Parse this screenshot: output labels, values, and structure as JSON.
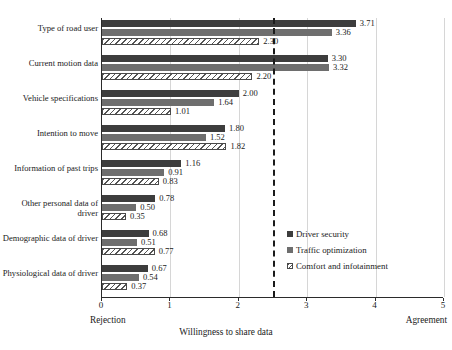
{
  "chart_data": {
    "type": "bar",
    "orientation": "horizontal",
    "title": "",
    "xlabel": "Willingness to share data",
    "ylabel": "",
    "xlim": [
      0,
      5
    ],
    "xticks": [
      0,
      1,
      2,
      3,
      4
    ],
    "xtick_labels": [
      "0",
      "1",
      "2",
      "3",
      "4",
      "5"
    ],
    "xtick_values": [
      0,
      1,
      2,
      3,
      4,
      5
    ],
    "grid": true,
    "grid_axis": "x",
    "legend_position": "inside-right",
    "axis_endpoint_labels": {
      "left": "Rejection",
      "right": "Agreement"
    },
    "reference_line": {
      "value": 2.5,
      "style": "dashed",
      "color": "#1a1a1a"
    },
    "categories": [
      "Type of road user",
      "Current motion data",
      "Vehicle specifications",
      "Intention to move",
      "Information of past trips",
      "Other personal data of driver",
      "Demographic data of driver",
      "Physiological data of driver"
    ],
    "series": [
      {
        "name": "Driver security",
        "color": "#3d3d3d",
        "pattern": "solid-dark",
        "values": [
          3.71,
          3.3,
          2.0,
          1.8,
          1.16,
          0.78,
          0.68,
          0.67
        ],
        "labels": [
          "3.71",
          "3.30",
          "2.00",
          "1.80",
          "1.16",
          "0.78",
          "0.68",
          "0.67"
        ]
      },
      {
        "name": "Traffic optimization",
        "color": "#6e6e6e",
        "pattern": "solid-gray",
        "values": [
          3.36,
          3.32,
          1.64,
          1.52,
          0.91,
          0.5,
          0.51,
          0.54
        ],
        "labels": [
          "3.36",
          "3.32",
          "1.64",
          "1.52",
          "0.91",
          "0.50",
          "0.51",
          "0.54"
        ]
      },
      {
        "name": "Comfort and infotainment",
        "color": "#ffffff",
        "pattern": "diagonal-hatch",
        "values": [
          2.3,
          2.2,
          1.01,
          1.82,
          0.83,
          0.35,
          0.77,
          0.37
        ],
        "labels": [
          "2.30",
          "2.20",
          "1.01",
          "1.82",
          "0.83",
          "0.35",
          "0.77",
          "0.37"
        ]
      }
    ]
  },
  "legend": {
    "items": [
      {
        "label": "Driver security"
      },
      {
        "label": "Traffic optimization"
      },
      {
        "label": "Comfort and infotainment"
      }
    ]
  }
}
